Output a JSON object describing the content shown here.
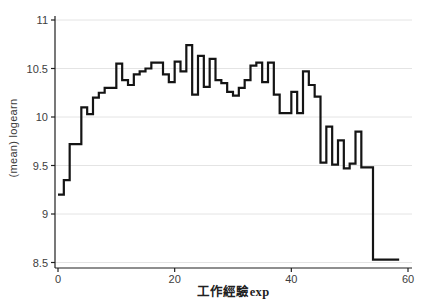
{
  "figure": {
    "background": "#ffffff",
    "line_color": "#141414",
    "grid_color": "#e4e4e4",
    "axis_color": "#1f1f1f",
    "tick_text_color": "#3d3d3d"
  },
  "chart_data": {
    "type": "line",
    "subtype": "step-after",
    "title": "",
    "xlabel": "工作經驗exp",
    "ylabel": "(mean) logearn",
    "legend": "none",
    "grid": "horizontal",
    "xlim": [
      0,
      60
    ],
    "ylim": [
      8.5,
      11
    ],
    "xticks": [
      0,
      20,
      40,
      60
    ],
    "yticks": [
      8.5,
      9,
      9.5,
      10,
      10.5,
      11
    ],
    "ytick_labels": [
      "8.5",
      "9",
      "9.5",
      "10",
      "10.5",
      "11"
    ],
    "xtick_labels": [
      "0",
      "20",
      "40",
      "60"
    ],
    "x": [
      0,
      1,
      2,
      3,
      4,
      5,
      6,
      7,
      8,
      9,
      10,
      11,
      12,
      13,
      14,
      15,
      16,
      17,
      18,
      19,
      20,
      21,
      22,
      23,
      24,
      25,
      26,
      27,
      28,
      29,
      30,
      31,
      32,
      33,
      34,
      35,
      36,
      37,
      38,
      39,
      40,
      41,
      42,
      43,
      44,
      45,
      46,
      47,
      48,
      49,
      50,
      51,
      52,
      53,
      54,
      55,
      56
    ],
    "values": [
      9.2,
      9.35,
      9.72,
      9.72,
      10.1,
      10.03,
      10.2,
      10.25,
      10.3,
      10.3,
      10.55,
      10.38,
      10.33,
      10.44,
      10.47,
      10.5,
      10.56,
      10.56,
      10.44,
      10.36,
      10.57,
      10.47,
      10.74,
      10.23,
      10.63,
      10.31,
      10.6,
      10.38,
      10.35,
      10.26,
      10.22,
      10.3,
      10.38,
      10.53,
      10.56,
      10.36,
      10.56,
      10.23,
      10.04,
      10.04,
      10.26,
      10.04,
      10.47,
      10.33,
      10.21,
      9.53,
      9.9,
      9.51,
      9.76,
      9.47,
      9.52,
      9.85,
      9.48,
      9.48,
      8.53,
      8.53,
      8.53
    ]
  }
}
